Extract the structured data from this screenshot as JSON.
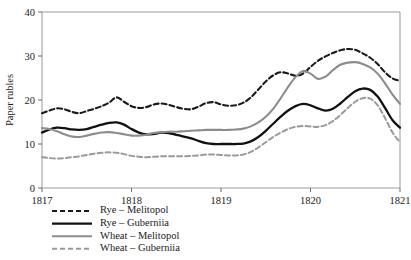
{
  "chart_data": {
    "type": "line",
    "title": "",
    "subtitle": "",
    "xlabel": "",
    "ylabel": "Paper rubles",
    "xlim": [
      1817,
      1821
    ],
    "ylim": [
      0,
      40
    ],
    "grid": false,
    "legend_position": "below-left",
    "x_ticks": [
      "1817",
      "1818",
      "1819",
      "1820",
      "1821"
    ],
    "x_tick_values": [
      1817,
      1818,
      1819,
      1820,
      1821
    ],
    "y_ticks": [
      "0",
      "10",
      "20",
      "30",
      "40"
    ],
    "y_tick_values": [
      0,
      10,
      20,
      30,
      40
    ],
    "x": [
      1817.0,
      1817.083,
      1817.167,
      1817.25,
      1817.333,
      1817.417,
      1817.5,
      1817.583,
      1817.667,
      1817.75,
      1817.833,
      1817.917,
      1818.0,
      1818.083,
      1818.167,
      1818.25,
      1818.333,
      1818.417,
      1818.5,
      1818.583,
      1818.667,
      1818.75,
      1818.833,
      1818.917,
      1819.0,
      1819.083,
      1819.167,
      1819.25,
      1819.333,
      1819.417,
      1819.5,
      1819.583,
      1819.667,
      1819.75,
      1819.833,
      1819.917,
      1820.0,
      1820.083,
      1820.167,
      1820.25,
      1820.333,
      1820.417,
      1820.5,
      1820.583,
      1820.667,
      1820.75,
      1820.833,
      1820.917,
      1821.0
    ],
    "series": [
      {
        "name": "Rye – Melitopol",
        "key": "rye-melitopol",
        "color": "#1a1a1a",
        "style": "dashed",
        "dasharray": "5,3",
        "width": 2.1,
        "values": [
          17.0,
          17.6,
          18.1,
          17.9,
          17.3,
          17.0,
          17.5,
          18.0,
          18.6,
          19.4,
          20.6,
          19.6,
          18.6,
          18.2,
          18.4,
          19.0,
          19.2,
          18.9,
          18.4,
          18.0,
          17.9,
          18.5,
          19.3,
          19.5,
          19.0,
          18.7,
          18.8,
          19.4,
          20.6,
          22.4,
          24.2,
          25.6,
          26.3,
          26.0,
          25.5,
          26.0,
          27.5,
          28.9,
          29.9,
          30.7,
          31.3,
          31.6,
          31.4,
          30.6,
          29.6,
          28.2,
          26.3,
          24.9,
          24.4
        ]
      },
      {
        "name": "Rye – Guberniia",
        "key": "rye-guberniia",
        "color": "#111111",
        "style": "solid",
        "dasharray": "none",
        "width": 2.3,
        "values": [
          12.6,
          13.3,
          13.7,
          13.6,
          13.3,
          13.2,
          13.4,
          13.9,
          14.4,
          14.8,
          14.9,
          14.4,
          13.4,
          12.6,
          12.2,
          12.3,
          12.6,
          12.5,
          12.1,
          11.7,
          11.3,
          10.7,
          10.2,
          10.0,
          10.0,
          10.0,
          10.0,
          10.1,
          10.6,
          11.6,
          13.0,
          14.6,
          16.2,
          17.6,
          18.6,
          19.1,
          18.8,
          18.1,
          17.6,
          18.0,
          19.2,
          20.7,
          22.0,
          22.6,
          22.3,
          20.8,
          18.2,
          15.4,
          13.7
        ]
      },
      {
        "name": "Wheat – Melitopol",
        "key": "wheat-melitopol",
        "color": "#8c8c8c",
        "style": "solid",
        "dasharray": "none",
        "width": 2.1,
        "values": [
          13.6,
          13.4,
          12.9,
          12.2,
          11.7,
          11.6,
          11.9,
          12.3,
          12.6,
          12.7,
          12.5,
          12.2,
          11.9,
          11.9,
          12.1,
          12.5,
          12.7,
          12.8,
          12.8,
          12.9,
          13.0,
          13.1,
          13.2,
          13.2,
          13.2,
          13.2,
          13.3,
          13.5,
          14.0,
          14.9,
          16.2,
          18.0,
          20.4,
          23.0,
          25.2,
          26.6,
          26.0,
          24.8,
          25.3,
          26.8,
          28.0,
          28.5,
          28.6,
          28.2,
          27.4,
          26.0,
          23.8,
          21.2,
          19.1
        ]
      },
      {
        "name": "Wheat – Guberniia",
        "key": "wheat-guberniia",
        "color": "#9a9a9a",
        "style": "dashed",
        "dasharray": "5,3",
        "width": 2.0,
        "values": [
          7.0,
          6.8,
          6.7,
          6.8,
          7.0,
          7.2,
          7.5,
          7.8,
          8.0,
          8.1,
          8.0,
          7.7,
          7.3,
          7.1,
          7.0,
          7.1,
          7.2,
          7.2,
          7.2,
          7.2,
          7.3,
          7.4,
          7.6,
          7.6,
          7.5,
          7.4,
          7.4,
          7.6,
          8.2,
          9.2,
          10.4,
          11.6,
          12.6,
          13.4,
          13.9,
          14.1,
          14.0,
          13.9,
          14.3,
          15.2,
          16.6,
          18.2,
          19.6,
          20.4,
          20.3,
          18.8,
          15.9,
          12.6,
          10.4
        ]
      }
    ],
    "legend": [
      {
        "label": "Rye – Melitopol",
        "color": "#1a1a1a",
        "style": "dashed",
        "dasharray": "5,3",
        "width": 2.1
      },
      {
        "label": "Rye – Guberniia",
        "color": "#111111",
        "style": "solid",
        "dasharray": "none",
        "width": 2.3
      },
      {
        "label": "Wheat – Melitopol",
        "color": "#8c8c8c",
        "style": "solid",
        "dasharray": "none",
        "width": 2.1
      },
      {
        "label": "Wheat – Guberniia",
        "color": "#9a9a9a",
        "style": "dashed",
        "dasharray": "5,3",
        "width": 2.0
      }
    ]
  },
  "plot": {
    "left": 42,
    "right": 400,
    "top": 12,
    "bottom": 188,
    "frame_color": "#9a9a9a"
  }
}
